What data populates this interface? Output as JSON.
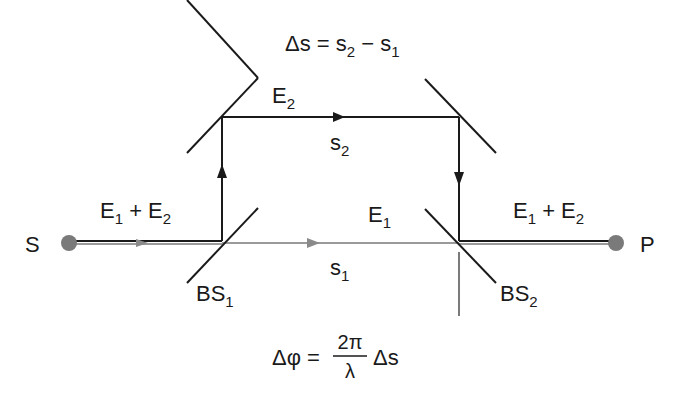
{
  "diagram": {
    "type": "Mach-Zehnder interferometer",
    "source_label": "S",
    "detector_label": "P",
    "beam_splitters": [
      {
        "main": "BS",
        "sub": "1"
      },
      {
        "main": "BS",
        "sub": "2"
      }
    ],
    "input_field": {
      "a": "E",
      "a_sub": "1",
      "op": " + ",
      "b": "E",
      "b_sub": "2"
    },
    "output_field": {
      "a": "E",
      "a_sub": "1",
      "op": " + ",
      "b": "E",
      "b_sub": "2"
    },
    "upper_field": {
      "main": "E",
      "sub": "2"
    },
    "lower_field": {
      "main": "E",
      "sub": "1"
    },
    "upper_path": {
      "main": "s",
      "sub": "2"
    },
    "lower_path": {
      "main": "s",
      "sub": "1"
    },
    "path_difference": {
      "lhs": "Δs = s",
      "s2_sub": "2",
      "minus": " − s",
      "s1_sub": "1"
    },
    "phase_difference": {
      "lhs": "Δφ =",
      "numerator": "2π",
      "denominator": "λ",
      "rhs": "Δs"
    },
    "colors": {
      "beam_dark": "#1a1a1a",
      "beam_gray": "#8a8a8a",
      "point": "#7a7a7a"
    }
  }
}
